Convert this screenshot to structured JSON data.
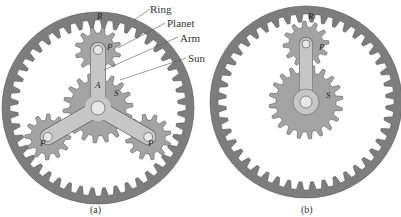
{
  "figure": {
    "panels": [
      {
        "id": "a",
        "caption": "(a)",
        "description": "Planetary gear train with three planets",
        "callouts": [
          "Ring",
          "Planet",
          "Arm",
          "Sun"
        ],
        "letters": {
          "ring": "R",
          "planet": "P",
          "arm": "A",
          "sun": "S",
          "planet_left": "P",
          "planet_right": "P"
        }
      },
      {
        "id": "b",
        "caption": "(b)",
        "description": "Planetary gear train with a single planet",
        "letters": {
          "ring": "R",
          "planet": "P",
          "sun": "S"
        }
      }
    ],
    "colors": {
      "ring": "#7d7d7d",
      "gear": "#a3a3a3",
      "arm": "#c6c6c6",
      "outline": "#4a4a4a",
      "background": "#ffffff"
    }
  }
}
